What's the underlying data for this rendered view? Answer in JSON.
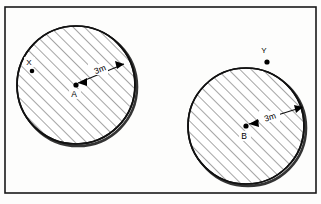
{
  "figure": {
    "background_color": "#fdfdfc",
    "line_color": "#111111",
    "hatch_color": "#2a2a2a",
    "frame": {
      "name": "figure-border",
      "x": 5,
      "y": 7,
      "width": 311,
      "height": 186
    },
    "circles": [
      {
        "id": "circle-a",
        "center_label": "A",
        "center_x": 76,
        "center_y": 85,
        "radius": 59,
        "radius_label": "3m",
        "radius_label_x": 101,
        "radius_label_y": 72,
        "center_label_x": 74,
        "center_label_y": 97,
        "hatched": true,
        "arrow_angle_deg": -40,
        "external_point": {
          "label": "X",
          "x": 32,
          "y": 71,
          "label_x": 29,
          "label_y": 65,
          "inside_circle": true
        }
      },
      {
        "id": "circle-b",
        "center_label": "B",
        "center_x": 246,
        "center_y": 126,
        "radius": 58,
        "radius_label": "3m",
        "radius_label_x": 271,
        "radius_label_y": 120,
        "center_label_x": 244,
        "center_label_y": 139,
        "hatched": true,
        "arrow_angle_deg": -18,
        "external_point": {
          "label": "Y",
          "x": 267,
          "y": 62,
          "label_x": 264,
          "label_y": 53,
          "inside_circle": false
        }
      }
    ],
    "hatch": {
      "spacing_px": 8,
      "angle_deg": -45,
      "stroke_width": 0.85
    }
  }
}
